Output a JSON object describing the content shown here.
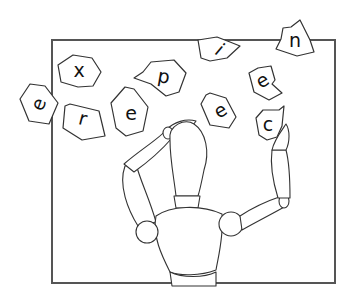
{
  "illustration": {
    "subject": "wooden mannequin juggling letter tiles inside a square frame",
    "word": "experience",
    "colors": {
      "stroke": "#333333",
      "frame": "#555555",
      "background": "#ffffff"
    },
    "tiles": [
      {
        "letter": "e",
        "x": 40,
        "y": 104,
        "rotate": -70
      },
      {
        "letter": "x",
        "x": 79,
        "y": 71,
        "rotate": 0
      },
      {
        "letter": "r",
        "x": 84,
        "y": 117,
        "rotate": 15
      },
      {
        "letter": "e",
        "x": 130,
        "y": 113,
        "rotate": 0
      },
      {
        "letter": "p",
        "x": 162,
        "y": 75,
        "rotate": 10
      },
      {
        "letter": "i",
        "x": 221,
        "y": 48,
        "rotate": 40
      },
      {
        "letter": "n",
        "x": 292,
        "y": 39,
        "rotate": 0
      },
      {
        "letter": "e",
        "x": 262,
        "y": 78,
        "rotate": -30
      },
      {
        "letter": "e",
        "x": 220,
        "y": 110,
        "rotate": -30
      },
      {
        "letter": "c",
        "x": 267,
        "y": 126,
        "rotate": 0
      }
    ]
  }
}
